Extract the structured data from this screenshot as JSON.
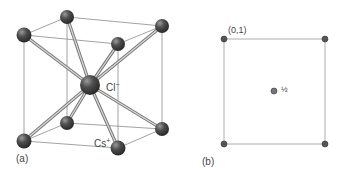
{
  "figure": {
    "panel_a": {
      "label": "(a)",
      "anion_label": "Cl",
      "anion_charge": "−",
      "cation_label": "Cs",
      "cation_charge": "+",
      "structure": "body-centered cubic CsCl unit cell"
    },
    "panel_b": {
      "label": "(b)",
      "corner_coordinate": "(0,1)",
      "center_fraction": "½"
    }
  },
  "colors": {
    "atom": "#4a4a4a",
    "line": "#8a8a8a",
    "bond": "#b0b0b0",
    "text": "#444444"
  }
}
